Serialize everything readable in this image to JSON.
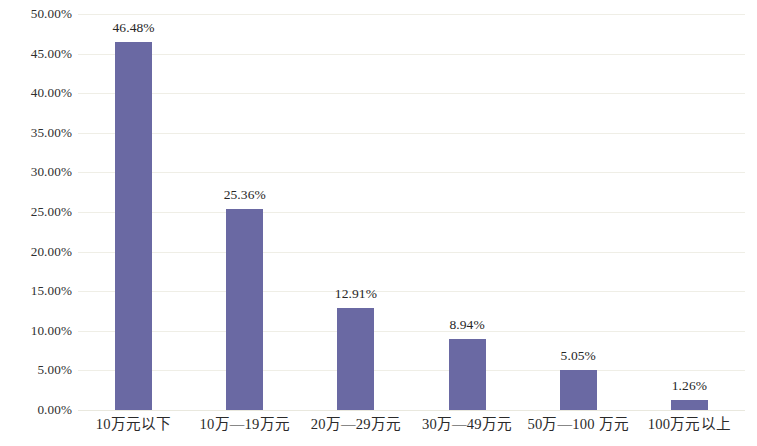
{
  "chart_data": {
    "type": "bar",
    "title": "",
    "subtitle": "",
    "xlabel": "",
    "ylabel": "",
    "categories": [
      "10万元以下",
      "10万—19万元",
      "20万—29万元",
      "30万—49万元",
      "50万—100 万元",
      "100万元以上"
    ],
    "values": [
      46.48,
      25.36,
      12.91,
      8.94,
      5.05,
      1.26
    ],
    "data_labels": [
      "46.48%",
      "25.36%",
      "12.91%",
      "8.94%",
      "5.05%",
      "1.26%"
    ],
    "ylim": [
      0,
      50
    ],
    "ytick_values": [
      0,
      5,
      10,
      15,
      20,
      25,
      30,
      35,
      40,
      45,
      50
    ],
    "ytick_labels": [
      "0.00%",
      "5.00%",
      "10.00%",
      "15.00%",
      "20.00%",
      "25.00%",
      "30.00%",
      "35.00%",
      "40.00%",
      "45.00%",
      "50.00%"
    ],
    "grid": true,
    "legend": false,
    "legend_position": "none",
    "series": [
      {
        "name": "",
        "values": [
          46.48,
          25.36,
          12.91,
          8.94,
          5.05,
          1.26
        ]
      }
    ],
    "colors": {
      "bar": "#6a69a3",
      "gridline": "#efeee6",
      "text": "#2a2a2a",
      "background": "#ffffff"
    }
  }
}
